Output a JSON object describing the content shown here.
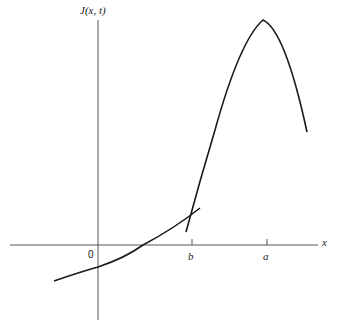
{
  "figure": {
    "y_axis_label": "J(x, t)",
    "x_axis_label": "x",
    "origin_label": "0",
    "ticks": [
      {
        "label": "b"
      },
      {
        "label": "a"
      }
    ]
  },
  "colors": {
    "line": "#1a1a1a",
    "axis": "#555555",
    "background": "#ffffff"
  }
}
